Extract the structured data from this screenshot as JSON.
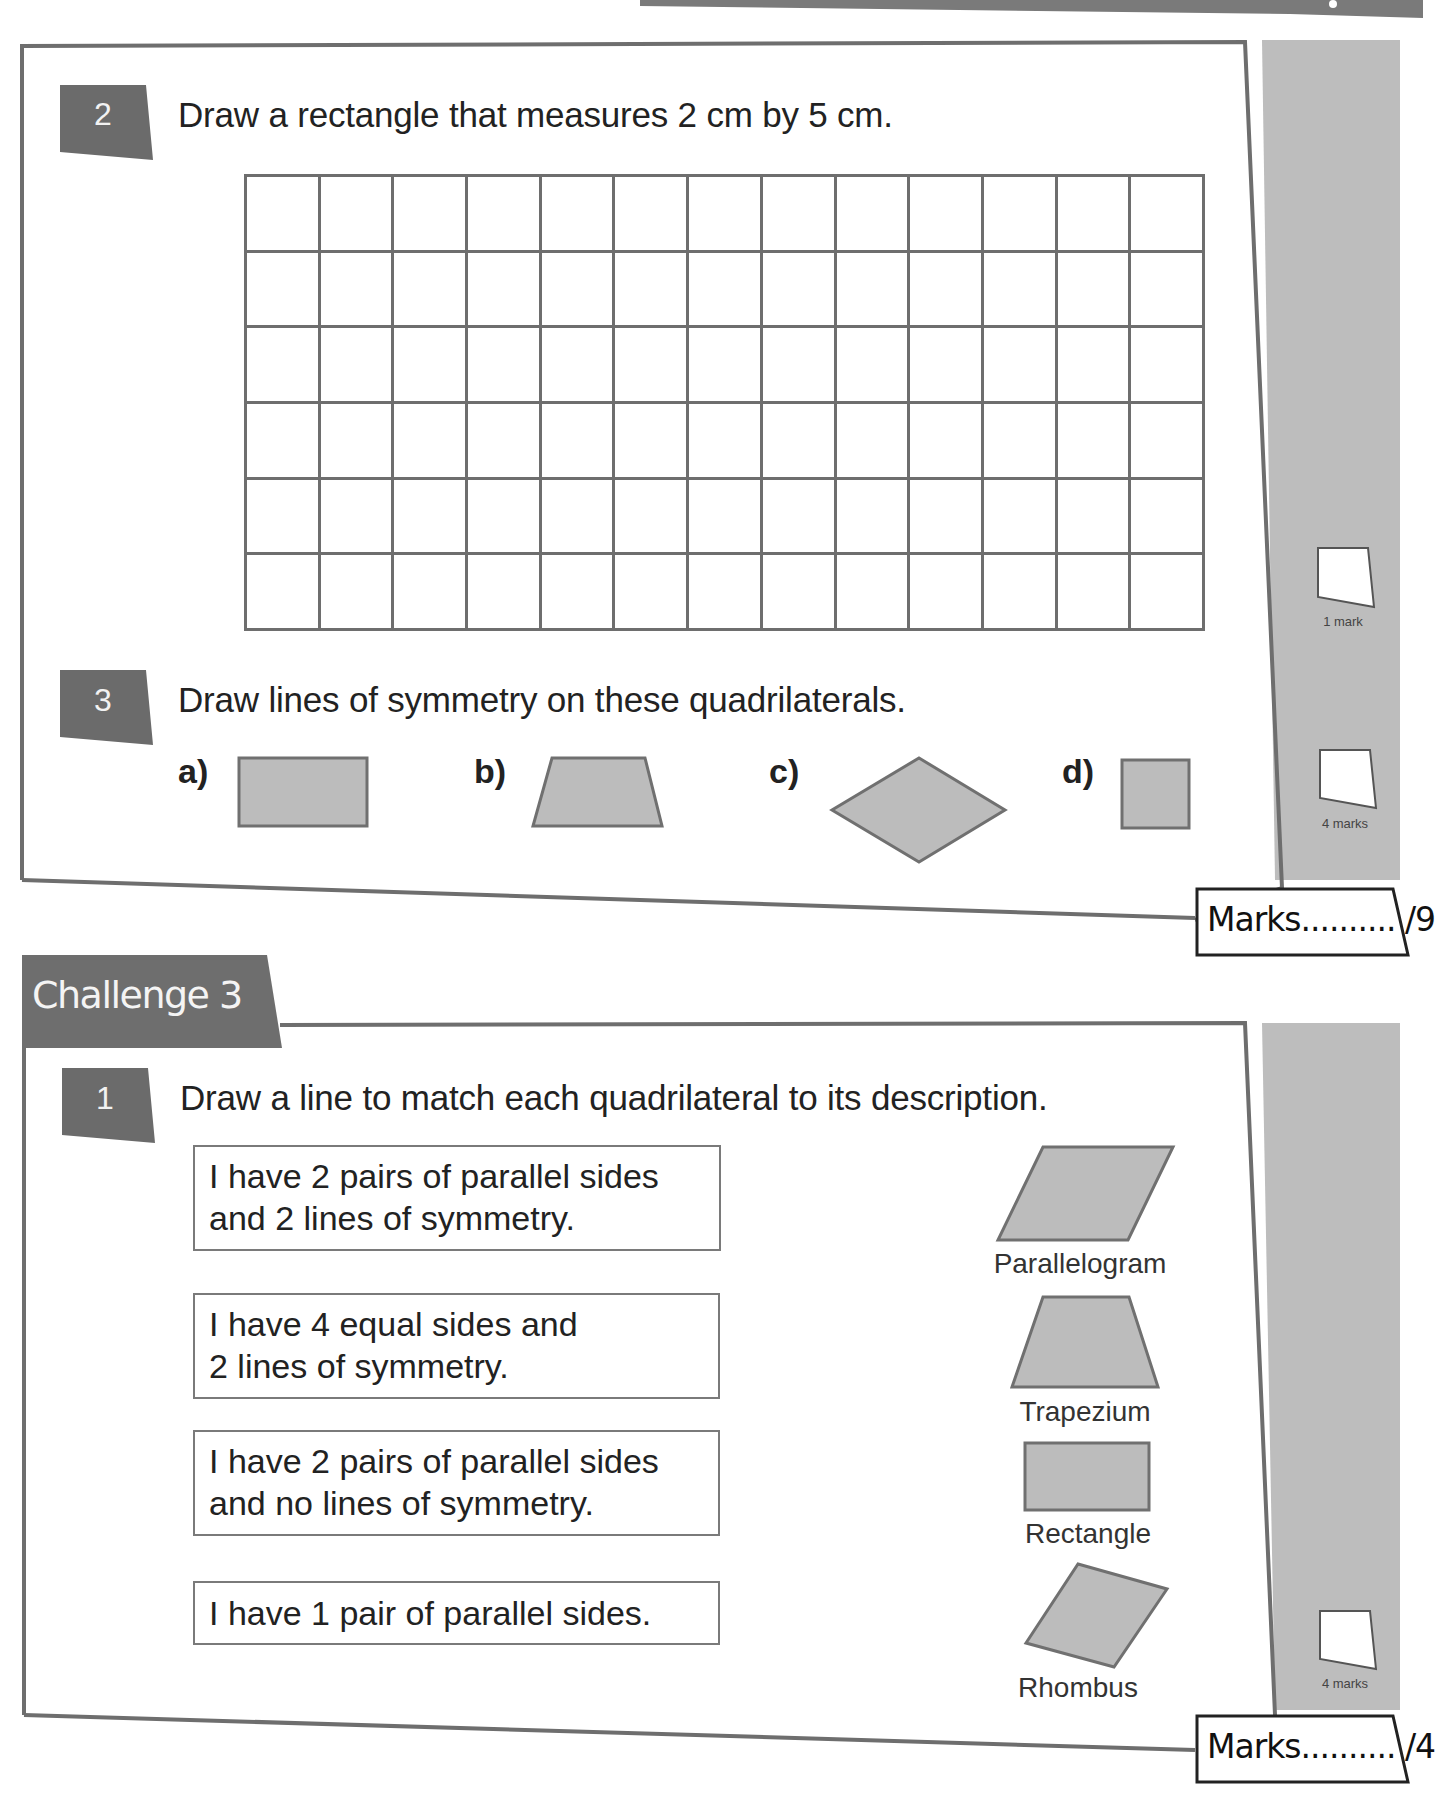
{
  "page": {
    "sidebar_color": "#bdbdbd",
    "badge_color": "#6b6b6b",
    "shape_fill": "#bcbcbc",
    "shape_stroke": "#707070",
    "border_color": "#707070"
  },
  "section_top": {
    "question_2": {
      "number": "2",
      "prompt": "Draw a rectangle that measures 2 cm by 5 cm.",
      "grid": {
        "columns": 13,
        "rows": 6
      },
      "mark_label": "1 mark"
    },
    "question_3": {
      "number": "3",
      "prompt": "Draw lines of symmetry on these quadrilaterals.",
      "items": [
        {
          "label": "a)",
          "shape": "rectangle"
        },
        {
          "label": "b)",
          "shape": "trapezium"
        },
        {
          "label": "c)",
          "shape": "rhombus"
        },
        {
          "label": "d)",
          "shape": "square"
        }
      ],
      "mark_label": "4 marks"
    },
    "marks_total": "Marks.......... /9"
  },
  "challenge_3": {
    "title": "Challenge 3",
    "question_1": {
      "number": "1",
      "prompt": "Draw a line to match each quadrilateral to its description.",
      "descriptions": [
        {
          "line1": "I have 2 pairs of parallel sides",
          "line2": "and 2 lines of symmetry."
        },
        {
          "line1": "I have 4 equal sides and",
          "line2": "2 lines of symmetry."
        },
        {
          "line1": "I have 2 pairs of parallel sides",
          "line2": "and no lines of symmetry."
        },
        {
          "line1": "I have 1 pair of parallel sides.",
          "line2": ""
        }
      ],
      "shapes": [
        {
          "name": "Parallelogram"
        },
        {
          "name": "Trapezium"
        },
        {
          "name": "Rectangle"
        },
        {
          "name": "Rhombus"
        }
      ],
      "mark_label": "4 marks"
    },
    "marks_total": "Marks.......... /4"
  }
}
